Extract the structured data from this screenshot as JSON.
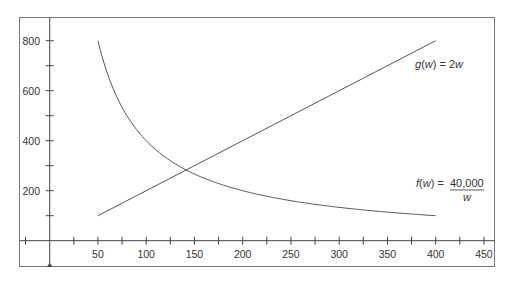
{
  "chart_data": {
    "type": "line",
    "title": "",
    "xlabel": "",
    "ylabel": "",
    "xlim": [
      -25,
      450
    ],
    "ylim": [
      0,
      850
    ],
    "grid": false,
    "x_ticks": [
      -25,
      25,
      50,
      75,
      100,
      125,
      150,
      175,
      200,
      225,
      250,
      275,
      300,
      325,
      350,
      375,
      400,
      425,
      450
    ],
    "x_tick_labels": [
      "50",
      "100",
      "150",
      "200",
      "250",
      "300",
      "350",
      "400",
      "450"
    ],
    "x_tick_label_values": [
      50,
      100,
      150,
      200,
      250,
      300,
      350,
      400,
      450
    ],
    "y_ticks": [
      100,
      200,
      300,
      400,
      500,
      600,
      700,
      800
    ],
    "y_tick_labels": [
      "200",
      "400",
      "600",
      "800"
    ],
    "y_tick_label_values": [
      200,
      400,
      600,
      800
    ],
    "series": [
      {
        "name": "f(w) = 40,000 / w",
        "label_prefix": "f(w) = ",
        "label_numerator": "40,000",
        "label_denominator": "w",
        "x": [
          50,
          60,
          75,
          100,
          125,
          141.4,
          150,
          200,
          250,
          300,
          350,
          400
        ],
        "values": [
          800,
          666.7,
          533.3,
          400,
          320,
          282.8,
          266.7,
          200,
          160,
          133.3,
          114.3,
          100
        ]
      },
      {
        "name": "g(w) = 2w",
        "label": "g(w) = 2w",
        "x": [
          50,
          400
        ],
        "values": [
          100,
          800
        ]
      }
    ],
    "intersection": {
      "w": 141.4,
      "value": 282.8
    },
    "annotations": [
      {
        "text": "g(w) = 2w",
        "near_w": 425,
        "near_value": 650
      },
      {
        "text": "f(w) = 40,000/w",
        "near_w": 425,
        "near_value": 200
      }
    ]
  },
  "colors": {
    "line": "#555555",
    "axis": "#444444",
    "frame": "#777777",
    "text": "#333333"
  }
}
